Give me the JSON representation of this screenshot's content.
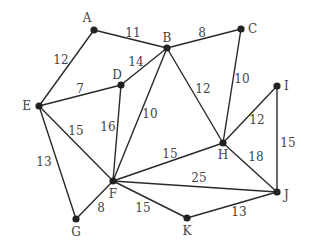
{
  "diagram": {
    "type": "weighted-undirected-graph",
    "colors": {
      "edge": "#2a2a2a",
      "node": "#222222",
      "text": "#444444"
    },
    "nodes": [
      {
        "id": "A",
        "x": 94,
        "y": 30,
        "lx": 87,
        "ly": 22,
        "anchor": "middle"
      },
      {
        "id": "B",
        "x": 167,
        "y": 48,
        "lx": 167,
        "ly": 42,
        "anchor": "middle"
      },
      {
        "id": "C",
        "x": 241,
        "y": 29,
        "lx": 248,
        "ly": 33,
        "anchor": "start"
      },
      {
        "id": "D",
        "x": 121,
        "y": 85,
        "lx": 117,
        "ly": 79,
        "anchor": "middle"
      },
      {
        "id": "E",
        "x": 39,
        "y": 106,
        "lx": 31,
        "ly": 110,
        "anchor": "end"
      },
      {
        "id": "F",
        "x": 113,
        "y": 181,
        "lx": 113,
        "ly": 198,
        "anchor": "middle"
      },
      {
        "id": "G",
        "x": 76,
        "y": 219,
        "lx": 76,
        "ly": 236,
        "anchor": "middle"
      },
      {
        "id": "H",
        "x": 223,
        "y": 143,
        "lx": 223,
        "ly": 159,
        "anchor": "middle"
      },
      {
        "id": "I",
        "x": 277,
        "y": 86,
        "lx": 284,
        "ly": 90,
        "anchor": "start"
      },
      {
        "id": "J",
        "x": 277,
        "y": 192,
        "lx": 284,
        "ly": 199,
        "anchor": "start"
      },
      {
        "id": "K",
        "x": 187,
        "y": 218,
        "lx": 187,
        "ly": 235,
        "anchor": "middle"
      }
    ],
    "edges": [
      {
        "from": "A",
        "to": "B",
        "weight": "11",
        "lx": 133,
        "ly": 37
      },
      {
        "from": "A",
        "to": "E",
        "weight": "12",
        "lx": 61,
        "ly": 64
      },
      {
        "from": "B",
        "to": "C",
        "weight": "8",
        "lx": 202,
        "ly": 37
      },
      {
        "from": "B",
        "to": "D",
        "weight": "14",
        "lx": 136,
        "ly": 66
      },
      {
        "from": "B",
        "to": "F",
        "weight": "10",
        "lx": 150,
        "ly": 118
      },
      {
        "from": "B",
        "to": "H",
        "weight": "12",
        "lx": 203,
        "ly": 93
      },
      {
        "from": "C",
        "to": "H",
        "weight": "10",
        "lx": 242,
        "ly": 83
      },
      {
        "from": "D",
        "to": "E",
        "weight": "7",
        "lx": 80,
        "ly": 93
      },
      {
        "from": "D",
        "to": "F",
        "weight": "16",
        "lx": 108,
        "ly": 131
      },
      {
        "from": "E",
        "to": "F",
        "weight": "15",
        "lx": 76,
        "ly": 135
      },
      {
        "from": "E",
        "to": "G",
        "weight": "13",
        "lx": 44,
        "ly": 166
      },
      {
        "from": "F",
        "to": "G",
        "weight": "8",
        "lx": 101,
        "ly": 212
      },
      {
        "from": "F",
        "to": "H",
        "weight": "15",
        "lx": 170,
        "ly": 158
      },
      {
        "from": "F",
        "to": "J",
        "weight": "25",
        "lx": 199,
        "ly": 182
      },
      {
        "from": "F",
        "to": "K",
        "weight": "15",
        "lx": 143,
        "ly": 212
      },
      {
        "from": "H",
        "to": "I",
        "weight": "12",
        "lx": 257,
        "ly": 124
      },
      {
        "from": "H",
        "to": "J",
        "weight": "18",
        "lx": 256,
        "ly": 161
      },
      {
        "from": "I",
        "to": "J",
        "weight": "15",
        "lx": 288,
        "ly": 147
      },
      {
        "from": "J",
        "to": "K",
        "weight": "13",
        "lx": 239,
        "ly": 216
      }
    ]
  }
}
